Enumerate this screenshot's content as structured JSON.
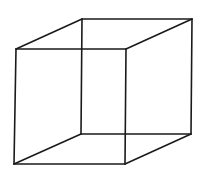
{
  "diagram": {
    "type": "wireframe-cube",
    "stroke_color": "#1a1a1a",
    "background": "#ffffff",
    "vertices": {
      "front_top_left": [
        16,
        49
      ],
      "front_top_right": [
        126,
        49
      ],
      "front_bottom_left": [
        14,
        164
      ],
      "front_bottom_right": [
        125,
        164
      ],
      "back_top_left": [
        82,
        19
      ],
      "back_top_right": [
        192,
        19
      ],
      "back_bottom_left": [
        81,
        134
      ],
      "back_bottom_right": [
        191,
        134
      ]
    }
  }
}
